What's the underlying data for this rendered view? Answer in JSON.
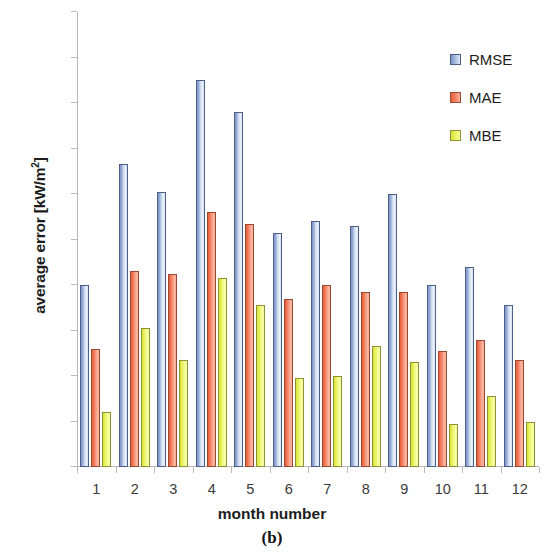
{
  "chart_data": {
    "type": "bar",
    "title": "",
    "xlabel": "month number",
    "ylabel": "average error [kW/m²]",
    "panel_caption": "(b)",
    "categories": [
      "1",
      "2",
      "3",
      "4",
      "5",
      "6",
      "7",
      "8",
      "9",
      "10",
      "11",
      "12"
    ],
    "ylim": [
      0.0,
      0.2
    ],
    "ytick_labels": [
      "0.00",
      "0.02",
      "0.04",
      "0.06",
      "0.08",
      "0.10",
      "0.12",
      "0.14",
      "0.16",
      "0.18",
      "0.20"
    ],
    "ytick_values": [
      0.0,
      0.02,
      0.04,
      0.06,
      0.08,
      0.1,
      0.12,
      0.14,
      0.16,
      0.18,
      0.2
    ],
    "grid": false,
    "legend_position": "top-right",
    "series": [
      {
        "name": "RMSE",
        "color": "#a9bee0",
        "values": [
          0.08,
          0.133,
          0.121,
          0.17,
          0.156,
          0.103,
          0.108,
          0.106,
          0.12,
          0.08,
          0.088,
          0.071
        ]
      },
      {
        "name": "MAE",
        "color": "#f2805f",
        "values": [
          0.052,
          0.086,
          0.085,
          0.112,
          0.107,
          0.074,
          0.08,
          0.077,
          0.077,
          0.051,
          0.056,
          0.047
        ]
      },
      {
        "name": "MBE",
        "color": "#e9f35f",
        "values": [
          0.024,
          0.061,
          0.047,
          0.083,
          0.071,
          0.039,
          0.04,
          0.053,
          0.046,
          0.019,
          0.031,
          0.02
        ]
      }
    ]
  }
}
